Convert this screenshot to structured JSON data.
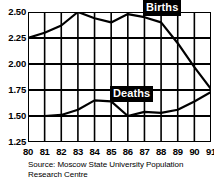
{
  "chart_data": {
    "type": "line",
    "title": "",
    "subtitle": "",
    "xlabel": "",
    "ylabel": "",
    "x": [
      "80",
      "81",
      "82",
      "83",
      "84",
      "85",
      "86",
      "87",
      "88",
      "89",
      "90",
      "91"
    ],
    "categories": [
      "80",
      "81",
      "82",
      "83",
      "84",
      "85",
      "86",
      "87",
      "88",
      "89",
      "90",
      "91"
    ],
    "xlim": [
      80,
      91
    ],
    "ylim": [
      1.25,
      2.5
    ],
    "y_ticks": [
      "2.50",
      "2.25",
      "2.00",
      "1.75",
      "1.50",
      "1.25"
    ],
    "y_tick_values": [
      2.5,
      2.25,
      2.0,
      1.75,
      1.5,
      1.25
    ],
    "x_ticks": [
      "80",
      "81",
      "82",
      "83",
      "84",
      "85",
      "86",
      "87",
      "88",
      "89",
      "90",
      "91"
    ],
    "grid": true,
    "grid_color": "#000000",
    "legend_position": "inline-callout",
    "series": [
      {
        "name": "Births",
        "color": "#000000",
        "values": [
          2.25,
          2.3,
          2.37,
          2.5,
          2.44,
          2.4,
          2.48,
          2.45,
          2.4,
          2.2,
          1.97,
          1.76
        ]
      },
      {
        "name": "Deaths",
        "color": "#000000",
        "values": [
          1.5,
          1.5,
          1.51,
          1.56,
          1.65,
          1.64,
          1.5,
          1.54,
          1.53,
          1.56,
          1.64,
          1.73
        ]
      }
    ],
    "annotations": [
      {
        "name": "births-callout",
        "text": "Births"
      },
      {
        "name": "deaths-callout",
        "text": "Deaths"
      }
    ],
    "source": "Source: Moscow State University Population Research Centre"
  },
  "labels": {
    "births": "Births",
    "deaths": "Deaths"
  },
  "footer": {
    "source": "Source: Moscow State University Population Research Centre"
  }
}
